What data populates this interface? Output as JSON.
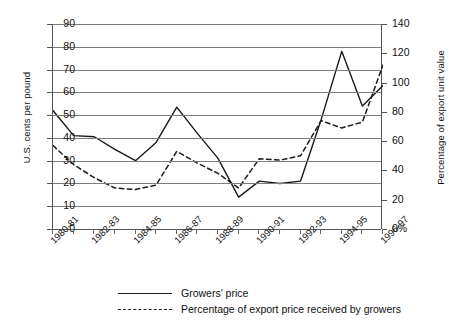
{
  "chart_data": {
    "type": "line",
    "title": "",
    "xlabel": "",
    "ylabel": "U.S. cents per pound",
    "y2label": "Percentage of export unit value",
    "grid": true,
    "legend_position": "bottom",
    "ylim": [
      0,
      90
    ],
    "y2lim": [
      0,
      140
    ],
    "yticks": [
      "0",
      "10",
      "20",
      "30",
      "40",
      "50",
      "60",
      "70",
      "80",
      "90"
    ],
    "y2ticks": [
      "0%",
      "20",
      "40",
      "60",
      "80",
      "100",
      "120",
      "140"
    ],
    "categories": [
      "1980-81",
      "1981-82",
      "1982-83",
      "1983-84",
      "1984-85",
      "1985-86",
      "1986-87",
      "1987-88",
      "1988-89",
      "1989-90",
      "1990-91",
      "1991-92",
      "1992-93",
      "1993-94",
      "1994-95",
      "1995-96",
      "1996-97"
    ],
    "tick_labels": [
      "1980-81",
      "1982-83",
      "1984-85",
      "1986-87",
      "1988-89",
      "1990-91",
      "1992-93",
      "1994-95",
      "1996-97"
    ],
    "series": [
      {
        "name": "Growers' price",
        "axis": "left",
        "style": "solid",
        "color": "#1a1a1a",
        "values": [
          52,
          41,
          40.5,
          35,
          30,
          38,
          53.5,
          42,
          31,
          14,
          21,
          20,
          21,
          48,
          78,
          54,
          63
        ]
      },
      {
        "name": "Percentage of export price received by growers",
        "axis": "right",
        "style": "dashed",
        "color": "#1a1a1a",
        "values": [
          57,
          44,
          35,
          28,
          27,
          30,
          53,
          45,
          38,
          28,
          48,
          47,
          50,
          74,
          69,
          73,
          112
        ]
      }
    ]
  },
  "legend": {
    "items": [
      {
        "label": "Growers' price",
        "style": "solid"
      },
      {
        "label": "Percentage of export price received by growers",
        "style": "dashed"
      }
    ]
  }
}
